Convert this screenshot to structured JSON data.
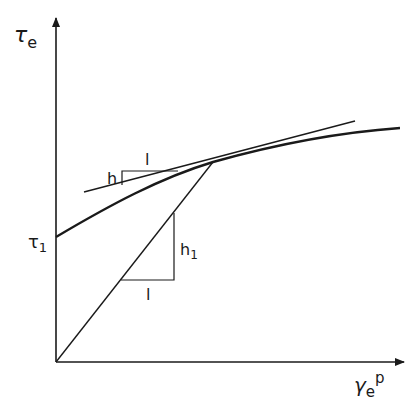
{
  "diagram": {
    "type": "stress-strain hardening curve",
    "labels": {
      "y_axis": "τ",
      "y_axis_sub": "e",
      "x_axis": "γ",
      "x_axis_sub": "e",
      "x_axis_sup": "p",
      "intercept": "τ",
      "intercept_sub": "1",
      "tangent_rise": "h",
      "tangent_run": "l",
      "secant_rise": "h",
      "secant_rise_sub": "1",
      "secant_run": "l"
    },
    "colors": {
      "ink": "#1a1a1a",
      "background": "#ffffff"
    }
  }
}
